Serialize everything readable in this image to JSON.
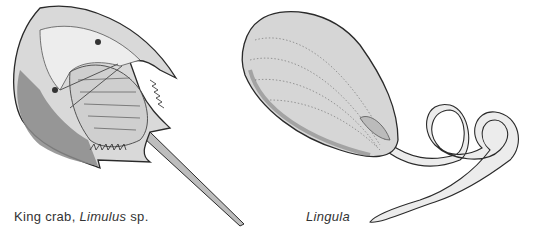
{
  "figures": [
    {
      "id": "king-crab",
      "caption": {
        "common_name": "King crab",
        "separator": ",",
        "genus": "Limulus",
        "suffix": "sp."
      }
    },
    {
      "id": "lingula",
      "caption": {
        "genus": "Lingula"
      }
    }
  ],
  "colors": {
    "ink": "#2a2a2a",
    "shade": "#8a8a8a",
    "light": "#d9d9d9"
  }
}
